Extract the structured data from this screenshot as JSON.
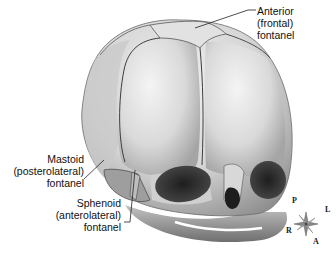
{
  "figure": {
    "labels": {
      "anterior": {
        "line1": "Anterior",
        "line2": "(frontal)",
        "line3": "fontanel"
      },
      "mastoid": {
        "line1": "Mastoid",
        "line2": "(posterolateral)",
        "line3": "fontanel"
      },
      "sphenoid": {
        "line1": "Sphenoid",
        "line2": "(anterolateral)",
        "line3": "fontanel"
      }
    },
    "compass": {
      "p": "P",
      "l": "L",
      "r": "R",
      "a": "A"
    },
    "colors": {
      "bone_light": "#e9e9e9",
      "bone_mid": "#bdbdbd",
      "bone_dark": "#7a7a7a",
      "cavity": "#2b2b2b",
      "suture": "#4a4a4a"
    }
  }
}
